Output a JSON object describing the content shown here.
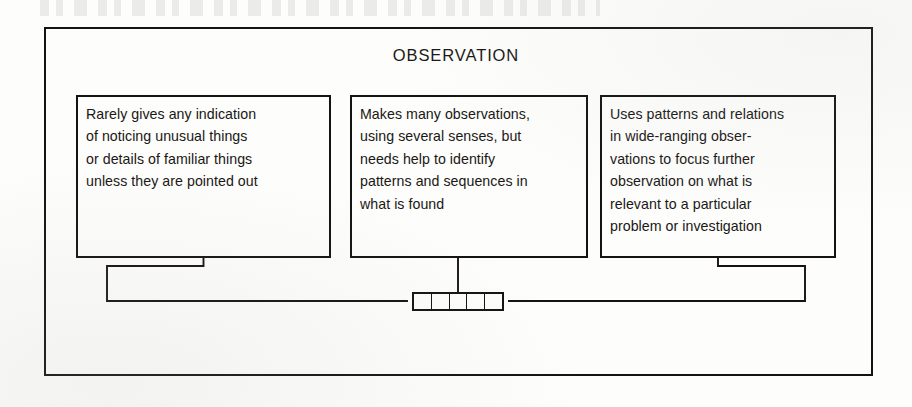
{
  "diagram": {
    "title": "OBSERVATION",
    "boxes": [
      {
        "id": "box-0",
        "level": "emerging",
        "text": "Rarely gives any indication\nof noticing unusual things\nor details of familiar things\nunless they are pointed out"
      },
      {
        "id": "box-1",
        "level": "developing",
        "text": "Makes many observations,\nusing several senses, but\nneeds help to identify\npatterns and sequences in\nwhat is found"
      },
      {
        "id": "box-2",
        "level": "secure",
        "text": "Uses patterns and relations\nin wide-ranging obser-\nvations to focus further\nobservation on what is\nrelevant to a particular\nproblem or investigation"
      }
    ],
    "progress_bar": {
      "segments": 5,
      "filled": 0
    },
    "colors": {
      "ink": "#15120f",
      "paper": "#fdfdfc"
    }
  }
}
